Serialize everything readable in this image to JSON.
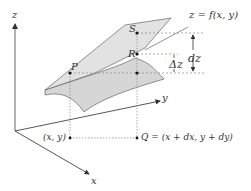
{
  "axes": {
    "x_label": "x",
    "y_label": "y",
    "z_label": "z"
  },
  "points": {
    "P": "P",
    "S": "S",
    "R": "R",
    "base_point": "(x, y)",
    "Q": "Q = (x + dx, y + dy)"
  },
  "surface_label": "z = f(x, y)",
  "increments": {
    "dz": "dz",
    "delta_z": "Δz"
  },
  "colors": {
    "surface_fill": "#dcdcdc",
    "line": "#555555",
    "dotted": "#888888"
  }
}
